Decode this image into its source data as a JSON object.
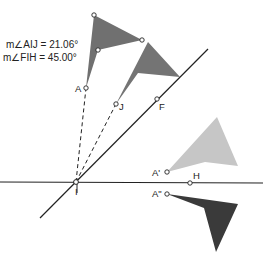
{
  "measurements": [
    {
      "label": "m∠AIJ = 21.06°"
    },
    {
      "label": "m∠FIH = 45.00°"
    }
  ],
  "points": {
    "A": "A",
    "J": "J",
    "F": "F",
    "I": "I",
    "H": "H",
    "A1": "A'",
    "A2": "A\""
  },
  "colors": {
    "flag_dark": "#6e6e6e",
    "flag_medium": "#808080",
    "flag_light": "#c4c4c4",
    "flag_darkest": "#3c3c3c",
    "line": "#222222"
  }
}
